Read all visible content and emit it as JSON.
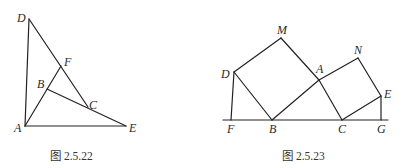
{
  "figures": [
    {
      "caption": "图 2.5.22",
      "points": {
        "D": [
          29,
          19
        ],
        "A": [
          25,
          126
        ],
        "E": [
          126,
          126
        ],
        "F": [
          61,
          66
        ],
        "B": [
          47,
          89
        ],
        "C": [
          88,
          107
        ]
      },
      "labels": [
        {
          "text": "D",
          "x": 17,
          "y": 22
        },
        {
          "text": "F",
          "x": 64,
          "y": 66
        },
        {
          "text": "B",
          "x": 37,
          "y": 88
        },
        {
          "text": "C",
          "x": 89,
          "y": 109
        },
        {
          "text": "A",
          "x": 14,
          "y": 132
        },
        {
          "text": "E",
          "x": 129,
          "y": 132
        }
      ],
      "segments": [
        [
          "D",
          "A"
        ],
        [
          "A",
          "E"
        ],
        [
          "D",
          "C"
        ],
        [
          "A",
          "F"
        ],
        [
          "B",
          "E"
        ]
      ]
    },
    {
      "caption": "图 2.5.23",
      "points": {
        "M": [
          281,
          38
        ],
        "D": [
          234,
          72
        ],
        "A": [
          319,
          80
        ],
        "N": [
          358,
          58
        ],
        "E": [
          381,
          96
        ],
        "F": [
          231,
          120
        ],
        "B": [
          272,
          120
        ],
        "C": [
          342,
          120
        ],
        "G": [
          381,
          120
        ]
      },
      "labels": [
        {
          "text": "M",
          "x": 277,
          "y": 34
        },
        {
          "text": "D",
          "x": 221,
          "y": 78
        },
        {
          "text": "A",
          "x": 316,
          "y": 73
        },
        {
          "text": "N",
          "x": 354,
          "y": 54
        },
        {
          "text": "E",
          "x": 384,
          "y": 98
        },
        {
          "text": "F",
          "x": 227,
          "y": 133
        },
        {
          "text": "B",
          "x": 269,
          "y": 133
        },
        {
          "text": "C",
          "x": 338,
          "y": 133
        },
        {
          "text": "G",
          "x": 377,
          "y": 133
        }
      ],
      "segments": [
        [
          "D",
          "M"
        ],
        [
          "M",
          "A"
        ],
        [
          "A",
          "B"
        ],
        [
          "B",
          "D"
        ],
        [
          "A",
          "N"
        ],
        [
          "N",
          "E"
        ],
        [
          "E",
          "C"
        ],
        [
          "C",
          "A"
        ],
        [
          "D",
          "F"
        ],
        [
          "E",
          "G"
        ],
        [
          "BASEL",
          "BASER"
        ]
      ],
      "extra_points": {
        "BASEL": [
          223,
          120
        ],
        "BASER": [
          388,
          120
        ]
      }
    }
  ]
}
